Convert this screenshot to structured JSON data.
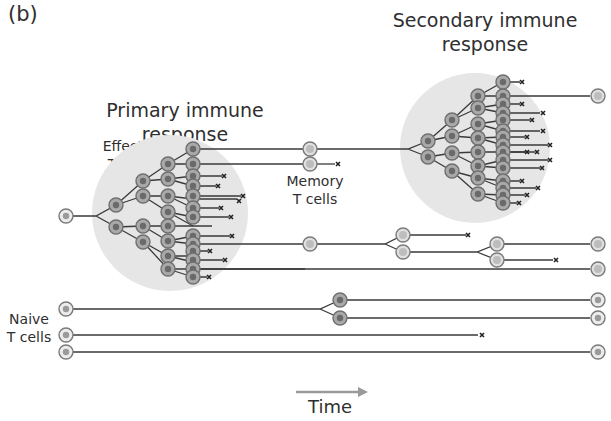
{
  "panel_label": "(b)",
  "labels": {
    "primary_title_line1": "Primary immune",
    "primary_title_line2": "response",
    "secondary_title_line1": "Secondary immune",
    "secondary_title_line2": "response",
    "effector_line1": "Effector",
    "effector_line2": "T cells",
    "memory_line1": "Memory",
    "memory_line2": "T cells",
    "naive_line1": "Naive",
    "naive_line2": "T cells",
    "time": "Time"
  },
  "colors": {
    "cloud": "#e4e4e4",
    "line": "#3a3a3a",
    "cell_ring": "#7a7a7a",
    "effector_fill": "#a8a8a8",
    "effector_core": "#6e6e6e",
    "memory_fill": "#d8d8d8",
    "memory_core": "#b5b5b5",
    "time_arrow": "#9a9a9a"
  },
  "legend": {
    "death_marker": "x",
    "death_meaning": "cell death"
  }
}
